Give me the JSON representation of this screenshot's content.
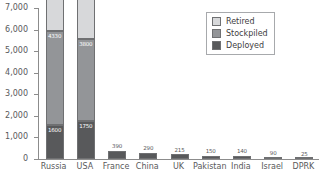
{
  "chart_data": {
    "type": "bar",
    "title": "",
    "subtitle": "",
    "xlabel": "",
    "ylabel": "",
    "stacked": true,
    "grid": false,
    "legend_position": "top-right",
    "ylim": [
      0,
      7000
    ],
    "yticks": [
      0,
      1000,
      2000,
      3000,
      4000,
      5000,
      6000,
      7000
    ],
    "ytick_labels": [
      "0",
      "1,000",
      "2,000",
      "3,000",
      "4,000",
      "5,000",
      "6,000",
      "7,000"
    ],
    "categories": [
      "Russia",
      "USA",
      "France",
      "China",
      "UK",
      "Pakistan",
      "India",
      "Israel",
      "DPRK"
    ],
    "series": [
      {
        "name": "Deployed",
        "color": "#58595b",
        "values": [
          1600,
          1750,
          390,
          290,
          215,
          150,
          140,
          90,
          25
        ]
      },
      {
        "name": "Stockpiled",
        "color": "#939598",
        "values": [
          4330,
          3800,
          0,
          0,
          0,
          0,
          0,
          0,
          0
        ]
      },
      {
        "name": "Retired",
        "color": "#d7d8da",
        "values": [
          2170,
          2385,
          0,
          0,
          0,
          0,
          0,
          0,
          0
        ]
      }
    ],
    "totals": [
      6500,
      6185,
      390,
      290,
      215,
      150,
      140,
      90,
      25
    ],
    "bars": [
      {
        "category": "Russia",
        "total_label": "6500",
        "segments": [
          {
            "name": "Deployed",
            "value": 1600,
            "label": "1600",
            "label_color": "on-dark"
          },
          {
            "name": "Stockpiled",
            "value": 4330,
            "label": "4330",
            "label_color": "on-dark"
          },
          {
            "name": "Retired",
            "value": 2170,
            "label": "2170",
            "label_color": "on-light"
          }
        ]
      },
      {
        "category": "USA",
        "total_label": "6185",
        "segments": [
          {
            "name": "Deployed",
            "value": 1750,
            "label": "1750",
            "label_color": "on-dark"
          },
          {
            "name": "Stockpiled",
            "value": 3800,
            "label": "3800",
            "label_color": "on-dark"
          },
          {
            "name": "Retired",
            "value": 2385,
            "label": "2385",
            "label_color": "on-light"
          }
        ]
      },
      {
        "category": "France",
        "total_label": "390",
        "segments": [
          {
            "name": "Deployed",
            "value": 390,
            "label": "",
            "label_color": "on-dark"
          }
        ]
      },
      {
        "category": "China",
        "total_label": "290",
        "segments": [
          {
            "name": "Deployed",
            "value": 290,
            "label": "",
            "label_color": "on-dark"
          }
        ]
      },
      {
        "category": "UK",
        "total_label": "215",
        "segments": [
          {
            "name": "Deployed",
            "value": 215,
            "label": "",
            "label_color": "on-dark"
          }
        ]
      },
      {
        "category": "Pakistan",
        "total_label": "150",
        "segments": [
          {
            "name": "Deployed",
            "value": 150,
            "label": "",
            "label_color": "on-dark"
          }
        ]
      },
      {
        "category": "India",
        "total_label": "140",
        "segments": [
          {
            "name": "Deployed",
            "value": 140,
            "label": "",
            "label_color": "on-dark"
          }
        ]
      },
      {
        "category": "Israel",
        "total_label": "90",
        "segments": [
          {
            "name": "Deployed",
            "value": 90,
            "label": "",
            "label_color": "on-dark"
          }
        ]
      },
      {
        "category": "DPRK",
        "total_label": "25",
        "segments": [
          {
            "name": "Deployed",
            "value": 25,
            "label": "",
            "label_color": "on-dark"
          }
        ]
      }
    ]
  },
  "legend": {
    "items": [
      {
        "label": "Retired",
        "swatch": "retired",
        "color": "#d7d8da"
      },
      {
        "label": "Stockpiled",
        "swatch": "stockpiled",
        "color": "#939598"
      },
      {
        "label": "Deployed",
        "swatch": "deployed",
        "color": "#58595b"
      }
    ]
  },
  "axis": {
    "y_tick_labels": [
      "7,000",
      "6,000",
      "5,000",
      "4,000",
      "3,000",
      "2,000",
      "1,000",
      "0"
    ],
    "x_tick_labels": [
      "Russia",
      "USA",
      "France",
      "China",
      "UK",
      "Pakistan",
      "India",
      "Israel",
      "DPRK"
    ]
  },
  "colors": {
    "axis": "#8c8c8c",
    "text": "#58595b",
    "retired": "#d7d8da",
    "stockpiled": "#939598",
    "deployed": "#58595b",
    "background": "#ffffff"
  }
}
